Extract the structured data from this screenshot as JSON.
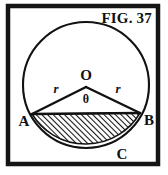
{
  "figure": {
    "caption": "FIG. 37",
    "border_color": "#151515",
    "stroke_color": "#111111",
    "background_color": "#ffffff",
    "hatch_color": "#121212",
    "labels": {
      "center": "O",
      "angle": "θ",
      "radius_left": "r",
      "radius_right": "r",
      "point_left": "A",
      "point_right": "B",
      "point_arc": "C"
    },
    "geometry": {
      "circle_center_x": 86,
      "circle_center_y": 85,
      "circle_radius": 63,
      "chord_left_x": 32,
      "chord_left_y": 114,
      "chord_right_x": 140,
      "chord_right_y": 113,
      "apex_x": 86,
      "apex_y": 87,
      "frame_left": 8,
      "frame_top": 6,
      "frame_width": 150,
      "frame_height": 158
    }
  }
}
